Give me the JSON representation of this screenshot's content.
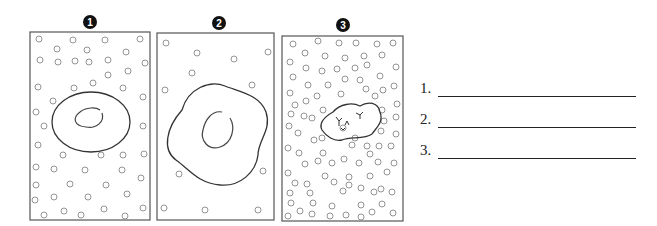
{
  "panels": [
    {
      "number": "1",
      "badge_label": "❶",
      "description": "cell in isotonic-like sparse solution with nucleus"
    },
    {
      "number": "2",
      "badge_label": "❷",
      "description": "swollen cell with very few solute particles outside"
    },
    {
      "number": "3",
      "badge_label": "❸",
      "description": "shrunken cell surrounded by dense solute particles"
    }
  ],
  "answers": [
    {
      "label": "1.",
      "value": ""
    },
    {
      "label": "2.",
      "value": ""
    },
    {
      "label": "3.",
      "value": ""
    }
  ],
  "colors": {
    "stroke": "#333333",
    "particle": "#777777",
    "badge": "#111111"
  }
}
